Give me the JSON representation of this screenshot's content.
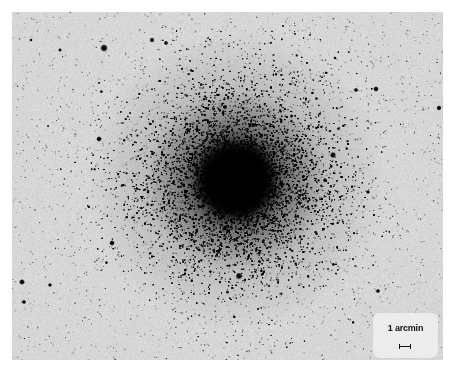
{
  "image": {
    "subject": "globular star cluster (negative print)",
    "background_color": "#d6d6d6",
    "page_color": "#ffffff",
    "star_color": "#000000",
    "frame": {
      "x": 12,
      "y": 12,
      "width": 431,
      "height": 348
    },
    "cluster_core": {
      "x": 236,
      "y": 180,
      "core_radius": 42,
      "halo_radius": 150
    },
    "bright_stars": [
      {
        "x": 104,
        "y": 48,
        "r": 2.2
      },
      {
        "x": 152,
        "y": 40,
        "r": 1.5
      },
      {
        "x": 166,
        "y": 43,
        "r": 1.3
      },
      {
        "x": 239,
        "y": 276,
        "r": 2.0
      },
      {
        "x": 333,
        "y": 155,
        "r": 1.8
      },
      {
        "x": 376,
        "y": 89,
        "r": 1.6
      },
      {
        "x": 356,
        "y": 90,
        "r": 1.3
      },
      {
        "x": 439,
        "y": 108,
        "r": 1.5
      },
      {
        "x": 99,
        "y": 139,
        "r": 1.6
      },
      {
        "x": 112,
        "y": 243,
        "r": 1.6
      },
      {
        "x": 22,
        "y": 282,
        "r": 1.7
      },
      {
        "x": 50,
        "y": 285,
        "r": 1.2
      },
      {
        "x": 24,
        "y": 302,
        "r": 1.3
      },
      {
        "x": 378,
        "y": 291,
        "r": 1.3
      },
      {
        "x": 368,
        "y": 192,
        "r": 1.2
      },
      {
        "x": 31,
        "y": 40,
        "r": 1.0
      },
      {
        "x": 60,
        "y": 50,
        "r": 1.1
      },
      {
        "x": 225,
        "y": 107,
        "r": 1.4
      },
      {
        "x": 325,
        "y": 180,
        "r": 1.2
      },
      {
        "x": 335,
        "y": 58,
        "r": 1.0
      }
    ]
  },
  "scale_bar": {
    "label": "1 arcmin",
    "box_color": "#ececec",
    "bar_length_px": 12
  }
}
